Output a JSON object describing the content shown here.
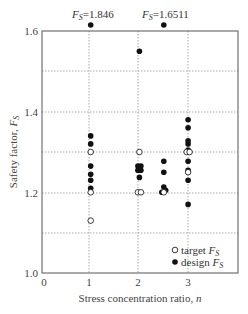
{
  "chart_data": {
    "type": "scatter",
    "title": "",
    "xlabel": "Stress concentration ratio, n",
    "ylabel": "Safety factor, F_S",
    "xlim": [
      0,
      4
    ],
    "ylim": [
      1.0,
      1.6
    ],
    "xticks": [
      0,
      1,
      2,
      3
    ],
    "yticks": [
      1.0,
      1.2,
      1.4,
      1.6
    ],
    "grid": true,
    "legend_position": "lower right",
    "series": [
      {
        "name": "target F_S",
        "marker": "open-circle",
        "points": [
          [
            1,
            1.3
          ],
          [
            1,
            1.2
          ],
          [
            1,
            1.13
          ],
          [
            2,
            1.3
          ],
          [
            1.97,
            1.2
          ],
          [
            2.03,
            1.2
          ],
          [
            2.5,
            1.2
          ],
          [
            2.97,
            1.3
          ],
          [
            3.03,
            1.3
          ],
          [
            3,
            1.25
          ]
        ]
      },
      {
        "name": "design F_S",
        "marker": "filled-circle",
        "points": [
          [
            1,
            1.846
          ],
          [
            1,
            1.34
          ],
          [
            1,
            1.32
          ],
          [
            1,
            1.265
          ],
          [
            1,
            1.245
          ],
          [
            1,
            1.23
          ],
          [
            1,
            1.21
          ],
          [
            2,
            1.55
          ],
          [
            1.97,
            1.265
          ],
          [
            2.03,
            1.265
          ],
          [
            1.97,
            1.255
          ],
          [
            2.03,
            1.255
          ],
          [
            2,
            1.26
          ],
          [
            2,
            1.237
          ],
          [
            2.5,
            1.6511
          ],
          [
            2.5,
            1.277
          ],
          [
            2.5,
            1.25
          ],
          [
            2.5,
            1.213
          ],
          [
            2.46,
            1.2
          ],
          [
            2.54,
            1.205
          ],
          [
            3,
            1.38
          ],
          [
            3,
            1.36
          ],
          [
            3,
            1.328
          ],
          [
            3,
            1.32
          ],
          [
            3,
            1.305
          ],
          [
            3,
            1.277
          ],
          [
            3,
            1.255
          ],
          [
            3,
            1.23
          ],
          [
            3,
            1.17
          ]
        ]
      }
    ],
    "annotations": [
      {
        "text": "F_S=1.846",
        "x": 1,
        "note": "off-scale point above 1.6"
      },
      {
        "text": "F_S=1.6511",
        "x": 2.5,
        "note": "off-scale point above 1.6"
      }
    ]
  },
  "labels": {
    "xlabel_main": "Stress concentration ratio, ",
    "xlabel_var": "n",
    "ylabel_main": "Safety factor, ",
    "ylabel_var": "F",
    "ylabel_sub": "S",
    "legend_target": "target ",
    "legend_design": "design ",
    "legend_var": "F",
    "legend_sub": "S",
    "ann1_var": "F",
    "ann1_sub": "S",
    "ann1_val": "=1.846",
    "ann2_var": "F",
    "ann2_sub": "S",
    "ann2_val": "=1.6511",
    "ytick_16": "1.6",
    "ytick_14": "1.4",
    "ytick_12": "1.2",
    "ytick_10": "1.0",
    "xtick_0": "0",
    "xtick_1": "1",
    "xtick_2": "2",
    "xtick_3": "3"
  }
}
